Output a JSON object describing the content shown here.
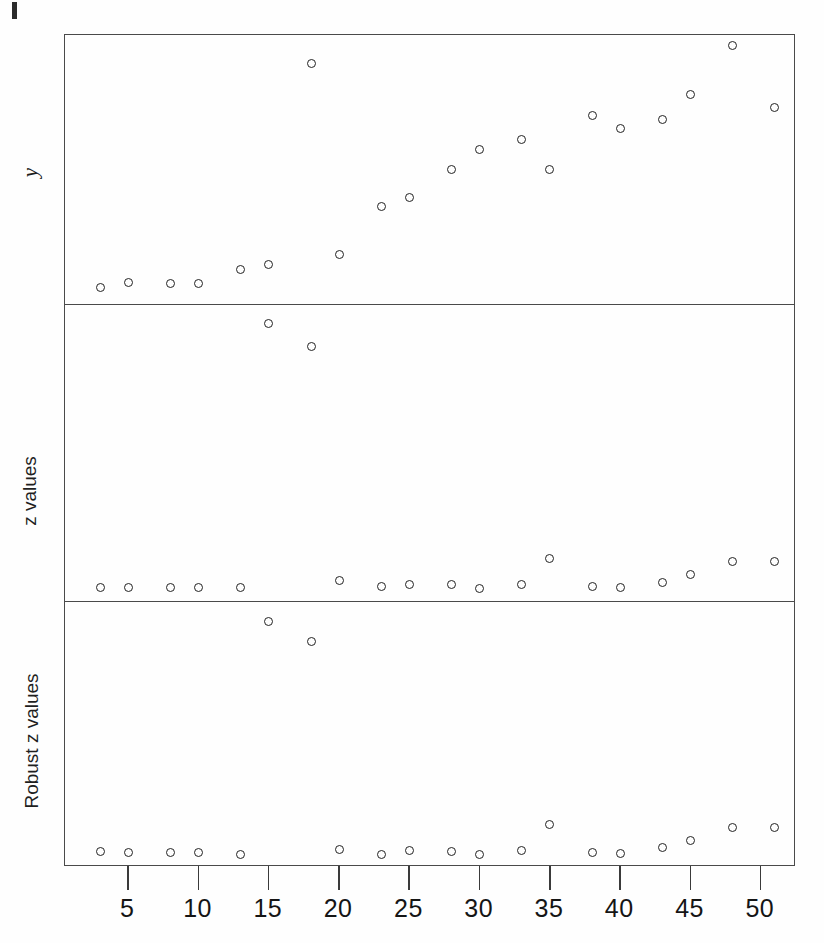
{
  "figure": {
    "background": "#ffffff",
    "marker_color": "#222222",
    "frame_color": "#4a4a4a",
    "corner_mark": "registration-tick"
  },
  "axis": {
    "x_ticks": [
      5,
      10,
      15,
      20,
      25,
      30,
      35,
      40,
      45,
      50
    ],
    "x_tick_labels": [
      "5",
      "10",
      "15",
      "20",
      "25",
      "30",
      "35",
      "40",
      "45",
      "50"
    ],
    "x_range": [
      0.5,
      52.5
    ],
    "x_label": ""
  },
  "panels": [
    {
      "id": "y",
      "ylabel": "y"
    },
    {
      "id": "z",
      "ylabel": "z values"
    },
    {
      "id": "robust_z",
      "ylabel": "Robust z values"
    }
  ],
  "chart_data": [
    {
      "type": "scatter",
      "title": "",
      "xlabel": "",
      "ylabel": "y",
      "xlim": [
        0.5,
        52.5
      ],
      "ylim": [
        0,
        1
      ],
      "grid": false,
      "legend": "none",
      "marker": "open-circle",
      "x": [
        3,
        5,
        8,
        10,
        13,
        15,
        18,
        20,
        23,
        25,
        28,
        30,
        33,
        35,
        38,
        40,
        43,
        45,
        48,
        51
      ],
      "values": [
        0.045,
        0.065,
        0.062,
        0.06,
        0.115,
        0.135,
        0.915,
        0.175,
        0.36,
        0.395,
        0.505,
        0.58,
        0.62,
        0.505,
        0.715,
        0.665,
        0.7,
        0.795,
        0.985,
        0.745
      ]
    },
    {
      "type": "scatter",
      "title": "",
      "xlabel": "",
      "ylabel": "z values",
      "xlim": [
        0.5,
        52.5
      ],
      "ylim": [
        0,
        1
      ],
      "grid": false,
      "legend": "none",
      "marker": "open-circle",
      "x": [
        3,
        5,
        8,
        10,
        13,
        15,
        18,
        20,
        23,
        25,
        28,
        30,
        33,
        35,
        38,
        40,
        43,
        45,
        48,
        51
      ],
      "values": [
        0.03,
        0.03,
        0.03,
        0.03,
        0.03,
        0.96,
        0.88,
        0.055,
        0.032,
        0.04,
        0.04,
        0.028,
        0.042,
        0.132,
        0.035,
        0.03,
        0.048,
        0.075,
        0.12,
        0.12
      ]
    },
    {
      "type": "scatter",
      "title": "",
      "xlabel": "",
      "ylabel": "Robust z values",
      "xlim": [
        0.5,
        52.5
      ],
      "ylim": [
        0,
        1
      ],
      "grid": false,
      "legend": "none",
      "marker": "open-circle",
      "x": [
        3,
        5,
        8,
        10,
        13,
        15,
        18,
        20,
        23,
        25,
        28,
        30,
        33,
        35,
        38,
        40,
        43,
        45,
        48,
        51
      ],
      "values": [
        0.032,
        0.03,
        0.028,
        0.028,
        0.022,
        0.95,
        0.87,
        0.042,
        0.022,
        0.038,
        0.035,
        0.022,
        0.038,
        0.14,
        0.028,
        0.025,
        0.048,
        0.078,
        0.128,
        0.128
      ]
    }
  ]
}
